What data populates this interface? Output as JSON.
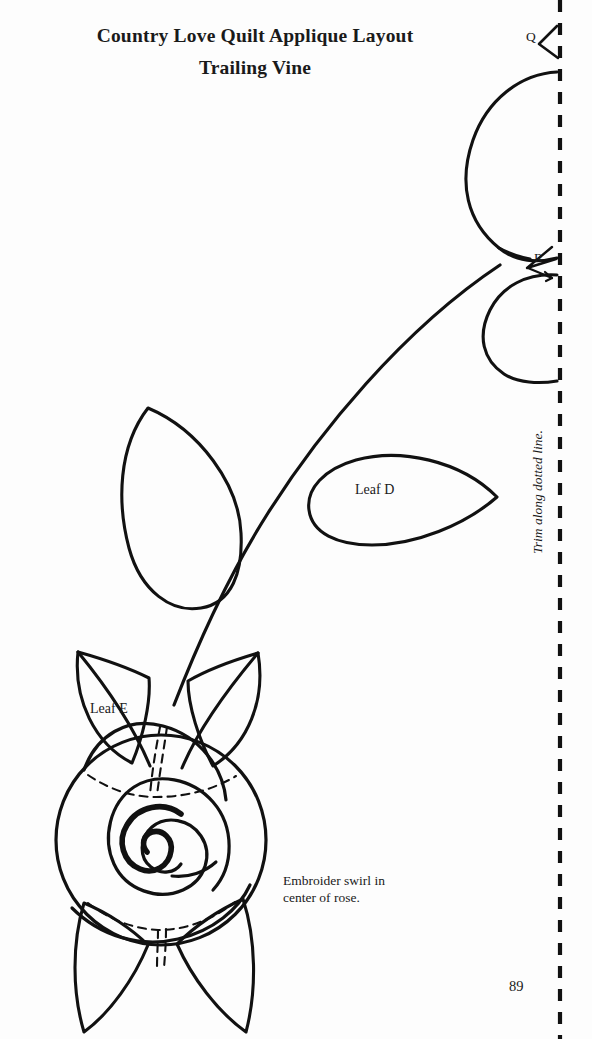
{
  "page": {
    "background_color": "#fdfdfd",
    "ink_color": "#111111",
    "width": 592,
    "height": 1039,
    "page_number": "89"
  },
  "title": {
    "line1": "Country Love Quilt Applique Layout",
    "line2": "Trailing Vine"
  },
  "labels": {
    "leaf_d": "Leaf D",
    "leaf_e": "Leaf E",
    "piece_q": "Q",
    "piece_r": "R"
  },
  "notes": {
    "embroider": "Embroider swirl in\ncenter of rose.",
    "trim": "Trim along dotted line."
  },
  "pattern": {
    "type": "applique-layout",
    "dashed_trim_line": {
      "x": 560,
      "dash_length": 12,
      "gap_length": 11,
      "stroke_width": 4
    },
    "stroke_widths": {
      "outline": 3,
      "dashed_placement": 2,
      "swirl": 6
    },
    "pieces": [
      {
        "name": "Q",
        "shape": "large-teardrop-petal",
        "clipped_by_trim_line": true
      },
      {
        "name": "R",
        "shape": "rounded-petal",
        "clipped_by_trim_line": true
      },
      {
        "name": "Leaf D",
        "shape": "horizontal-teardrop-leaf",
        "clipped_by_trim_line": false
      },
      {
        "name": "Leaf E",
        "shape": "pointed-rose-leaf",
        "clipped_by_trim_line": false
      },
      {
        "name": "Rose",
        "shape": "spiral-rose-with-swirl",
        "clipped_by_trim_line": false
      },
      {
        "name": "Unlabeled Leaf",
        "shape": "teardrop-leaf",
        "clipped_by_trim_line": false
      }
    ]
  }
}
